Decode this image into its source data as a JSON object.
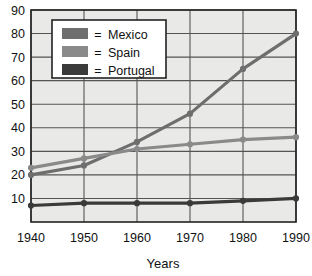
{
  "chart_data": {
    "type": "line",
    "title": "",
    "subtitle": "",
    "xlabel": "Years",
    "ylabel": "",
    "x": [
      1940,
      1950,
      1960,
      1970,
      1980,
      1990
    ],
    "categories": [
      "1940",
      "1950",
      "1960",
      "1970",
      "1980",
      "1990"
    ],
    "series": [
      {
        "name": "Mexico",
        "color": "#6e6e6e",
        "values": [
          20,
          24,
          34,
          46,
          65,
          80
        ]
      },
      {
        "name": "Spain",
        "color": "#8a8a8a",
        "values": [
          23,
          27,
          31,
          33,
          35,
          36
        ]
      },
      {
        "name": "Portugal",
        "color": "#3a3a3a",
        "values": [
          7,
          8,
          8,
          8,
          9,
          10
        ]
      }
    ],
    "xlim": [
      1940,
      1990
    ],
    "ylim": [
      0,
      90
    ],
    "yticks": [
      10,
      20,
      30,
      40,
      50,
      60,
      70,
      80,
      90
    ],
    "xticks": [
      1940,
      1950,
      1960,
      1970,
      1980,
      1990
    ],
    "grid": true,
    "legend_position": "top-left",
    "legend_separator": "="
  },
  "legend": {
    "separator": "=",
    "entries": [
      {
        "label": "Mexico",
        "swatch_color": "#6e6e6e"
      },
      {
        "label": "Spain",
        "swatch_color": "#8a8a8a"
      },
      {
        "label": "Portugal",
        "swatch_color": "#3a3a3a"
      }
    ]
  },
  "axes": {
    "x_title": "Years",
    "y_labels": [
      "90",
      "80",
      "70",
      "60",
      "50",
      "40",
      "30",
      "20",
      "10"
    ],
    "x_labels": [
      "1940",
      "1950",
      "1960",
      "1970",
      "1980",
      "1990"
    ]
  },
  "colors": {
    "plot_background": "#e9e9e7",
    "grid_line": "#555555",
    "axis_line": "#222222",
    "page_background": "#ffffff",
    "legend_background": "#ffffff",
    "legend_border": "#222222",
    "text": "#111111"
  }
}
